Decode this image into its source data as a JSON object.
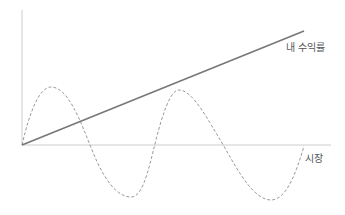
{
  "diagram": {
    "labels": {
      "my_return": "내 수익률",
      "market": "시장"
    },
    "colors": {
      "axis": "#cccccc",
      "my_return_line": "#777777",
      "market_line": "#999999",
      "text": "#555555"
    },
    "axes": {
      "origin": [
        22,
        145
      ],
      "x_end": 331,
      "y_top": 10
    },
    "my_return_line": {
      "from": [
        22,
        145
      ],
      "to": [
        304,
        31
      ]
    },
    "market_wave": {
      "peaks": [
        [
          51,
          87
        ],
        [
          179,
          90
        ]
      ],
      "troughs": [
        [
          131,
          197
        ],
        [
          271,
          200
        ]
      ],
      "end": [
        304,
        146
      ]
    }
  }
}
